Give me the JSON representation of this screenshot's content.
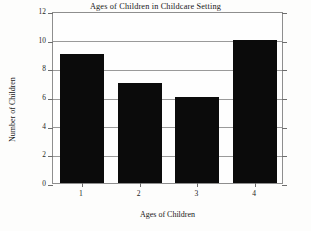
{
  "chart_data": {
    "type": "bar",
    "title": "Ages of Children in Childcare Setting",
    "xlabel": "Ages of Children",
    "ylabel": "Number of Children",
    "categories": [
      "1",
      "2",
      "3",
      "4"
    ],
    "values": [
      9,
      7,
      6,
      10
    ],
    "ylim": [
      0,
      12
    ],
    "ytick_labels": [
      "0",
      "2",
      "4",
      "6",
      "8",
      "10",
      "12"
    ],
    "ytick_values": [
      0,
      2,
      4,
      6,
      8,
      10,
      12
    ],
    "grid": true,
    "legend": "none",
    "bar_color": "#0b0b0b",
    "grid_color": "#9a9a9a",
    "frame_color": "#8e8e8e",
    "background_color": "#fdfdfc"
  }
}
